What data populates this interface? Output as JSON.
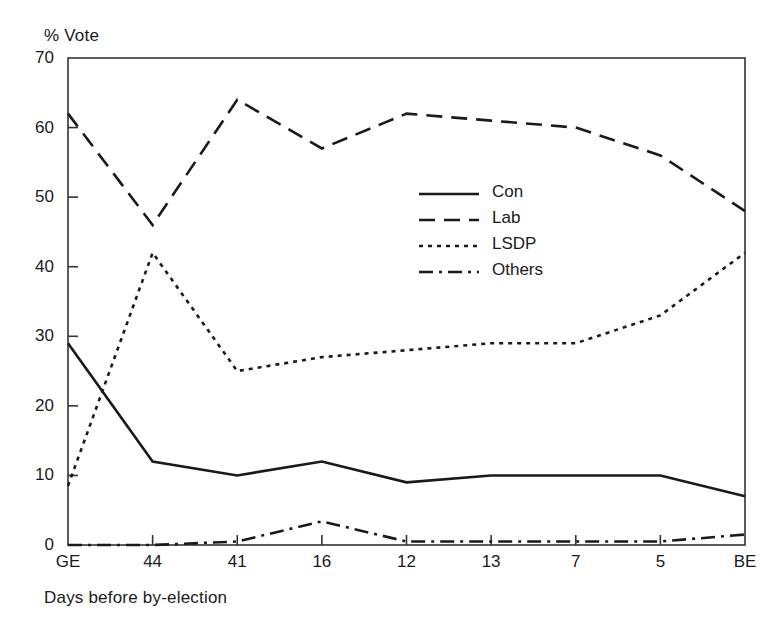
{
  "chart_data": {
    "type": "line",
    "title": "",
    "xlabel": "Days before by-election",
    "ylabel": "% Vote",
    "ylim": [
      0,
      70
    ],
    "ytick_labels": [
      "70",
      "60",
      "50",
      "40",
      "30",
      "20",
      "10",
      "0"
    ],
    "yticks": [
      70,
      60,
      50,
      40,
      30,
      20,
      10,
      0
    ],
    "grid": false,
    "legend_position": "center-right-inside",
    "categories": [
      "GE",
      "44",
      "41",
      "16",
      "12",
      "13",
      "7",
      "5",
      "BE"
    ],
    "series": [
      {
        "name": "Con",
        "style": "solid",
        "values": [
          29,
          12,
          10,
          12,
          9,
          10,
          10,
          10,
          7
        ]
      },
      {
        "name": "Lab",
        "style": "dashed",
        "values": [
          62,
          46,
          64,
          57,
          62,
          61,
          60,
          56,
          48
        ]
      },
      {
        "name": "LSDP",
        "style": "dotted",
        "values": [
          8.5,
          42,
          25,
          27,
          28,
          29,
          29,
          33,
          42
        ]
      },
      {
        "name": "Others",
        "style": "dashdot",
        "values": [
          0,
          0,
          0.5,
          3.4,
          0.5,
          0.5,
          0.5,
          0.5,
          1.5
        ]
      }
    ]
  },
  "axes": {
    "y_axis_title": "% Vote",
    "x_axis_title": "Days before by-election"
  },
  "legend": {
    "items": [
      {
        "label": "Con"
      },
      {
        "label": "Lab"
      },
      {
        "label": "LSDP"
      },
      {
        "label": "Others"
      }
    ]
  },
  "colors": {
    "line": "#1a1a1a",
    "axis": "#333333",
    "background": "#ffffff"
  }
}
